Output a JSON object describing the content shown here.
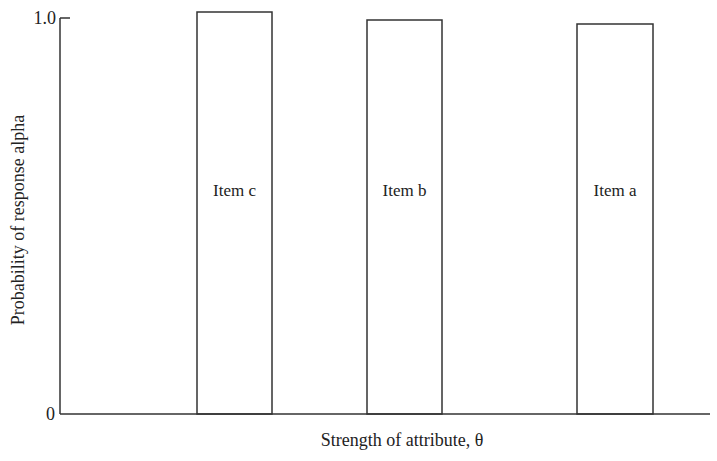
{
  "chart_data": {
    "type": "bar",
    "title": "",
    "xlabel": "Strength of attribute, θ",
    "ylabel": "Probability of response alpha",
    "y_ticks": [
      "0",
      "1.0"
    ],
    "ylim": [
      0,
      1.0
    ],
    "grid": false,
    "legend": null,
    "categories": [
      "Item c",
      "Item b",
      "Item a"
    ],
    "values": [
      1.0,
      1.0,
      1.0
    ],
    "bar_x_range_px": [
      [
        197,
        272
      ],
      [
        367,
        442
      ],
      [
        577,
        653
      ]
    ],
    "bar_top_px": [
      12,
      20,
      24
    ],
    "annotations": [
      "Item c",
      "Item b",
      "Item a"
    ]
  },
  "axes": {
    "origin_x": 60,
    "baseline_y": 414,
    "top_y": 18,
    "right_x": 710,
    "y_tick_top": "1.0",
    "y_tick_bottom": "0"
  }
}
